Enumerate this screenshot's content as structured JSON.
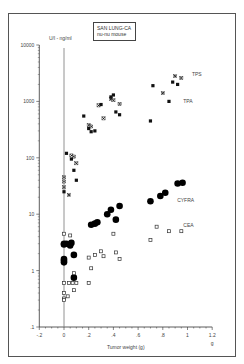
{
  "chart_data": {
    "type": "scatter",
    "title": "SAN LUNG-CA nu-nu mouse",
    "title_lines": [
      "SAN  LUNG-CA",
      "nu-nu mouse"
    ],
    "xlabel": "Tumor weight (g)",
    "x_unit": "g",
    "ylabel": "U/l - ng/ml",
    "yscale": "log",
    "xlim": [
      -0.2,
      1.2
    ],
    "ylim": [
      0.1,
      10000
    ],
    "x_ticks": [
      "-.2",
      "0",
      ".2",
      ".4",
      ".6",
      ".8",
      "1",
      "1.2"
    ],
    "y_ticks": [
      ".1",
      "1",
      "10",
      "100",
      "1000",
      "10000"
    ],
    "grid": false,
    "series": [
      {
        "name": "TPS",
        "marker": "x",
        "points": [
          [
            0.0,
            45
          ],
          [
            0.0,
            38
          ],
          [
            0.0,
            30
          ],
          [
            0.04,
            22
          ],
          [
            0.06,
            110
          ],
          [
            0.08,
            105
          ],
          [
            0.1,
            80
          ],
          [
            0.2,
            380
          ],
          [
            0.22,
            360
          ],
          [
            0.28,
            850
          ],
          [
            0.32,
            500
          ],
          [
            0.38,
            1100
          ],
          [
            0.4,
            1050
          ],
          [
            0.45,
            900
          ],
          [
            0.8,
            1400
          ],
          [
            0.9,
            2800
          ],
          [
            0.95,
            2600
          ]
        ]
      },
      {
        "name": "TPA",
        "marker": "square-filled",
        "points": [
          [
            0.0,
            25
          ],
          [
            0.02,
            120
          ],
          [
            0.06,
            95
          ],
          [
            0.08,
            60
          ],
          [
            0.1,
            40
          ],
          [
            0.16,
            550
          ],
          [
            0.2,
            330
          ],
          [
            0.22,
            290
          ],
          [
            0.25,
            300
          ],
          [
            0.3,
            880
          ],
          [
            0.38,
            1200
          ],
          [
            0.4,
            1300
          ],
          [
            0.42,
            650
          ],
          [
            0.45,
            580
          ],
          [
            0.7,
            450
          ],
          [
            0.72,
            1900
          ],
          [
            0.85,
            1000
          ],
          [
            0.88,
            2200
          ],
          [
            0.92,
            2000
          ]
        ]
      },
      {
        "name": "CYFRA",
        "marker": "circle-filled",
        "points": [
          [
            0.0,
            3.0
          ],
          [
            0.0,
            2.9
          ],
          [
            0.0,
            1.6
          ],
          [
            0.0,
            1.5
          ],
          [
            0.0,
            1.4
          ],
          [
            0.02,
            3.0
          ],
          [
            0.05,
            2.8
          ],
          [
            0.06,
            3.1
          ],
          [
            0.08,
            1.9
          ],
          [
            0.08,
            0.75
          ],
          [
            0.22,
            6.5
          ],
          [
            0.25,
            6.8
          ],
          [
            0.27,
            7.2
          ],
          [
            0.35,
            10
          ],
          [
            0.38,
            12
          ],
          [
            0.42,
            8
          ],
          [
            0.45,
            14
          ],
          [
            0.7,
            17
          ],
          [
            0.78,
            21
          ],
          [
            0.82,
            24
          ],
          [
            0.92,
            35
          ],
          [
            0.96,
            36
          ]
        ]
      },
      {
        "name": "CEA",
        "marker": "square-open",
        "points": [
          [
            0.0,
            4.5
          ],
          [
            0.0,
            0.6
          ],
          [
            0.0,
            0.4
          ],
          [
            0.0,
            0.32
          ],
          [
            0.0,
            0.3
          ],
          [
            0.03,
            0.35
          ],
          [
            0.04,
            0.6
          ],
          [
            0.05,
            4.2
          ],
          [
            0.07,
            0.6
          ],
          [
            0.08,
            0.9
          ],
          [
            0.08,
            0.45
          ],
          [
            0.1,
            0.6
          ],
          [
            0.2,
            1.7
          ],
          [
            0.2,
            0.6
          ],
          [
            0.22,
            1.1
          ],
          [
            0.25,
            1.9
          ],
          [
            0.3,
            2.2
          ],
          [
            0.32,
            1.8
          ],
          [
            0.4,
            4.5
          ],
          [
            0.42,
            2.1
          ],
          [
            0.45,
            1.6
          ],
          [
            0.7,
            3.5
          ],
          [
            0.75,
            6
          ],
          [
            0.85,
            5
          ],
          [
            0.95,
            5
          ]
        ]
      }
    ],
    "series_labels": [
      {
        "name": "TPS",
        "x": 1.02,
        "y": 3000
      },
      {
        "name": "TPA",
        "x": 0.95,
        "y": 1000
      },
      {
        "name": "CYFRA",
        "x": 0.9,
        "y": 18
      },
      {
        "name": "CEA",
        "x": 0.95,
        "y": 6.5
      }
    ]
  }
}
